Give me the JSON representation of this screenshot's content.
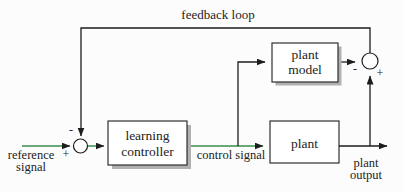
{
  "title": {
    "feedback_label": "feedback loop"
  },
  "blocks": {
    "learning_controller": {
      "line1": "learning",
      "line2": "controller"
    },
    "plant_model": {
      "line1": "plant",
      "line2": "model"
    },
    "plant": {
      "label": "plant"
    }
  },
  "signals": {
    "reference": {
      "line1": "reference",
      "line2": "signal"
    },
    "control": {
      "label": "control signal"
    },
    "output": {
      "line1": "plant",
      "line2": "output"
    }
  },
  "junctions": {
    "left": {
      "minus": "-",
      "plus": "+"
    },
    "right": {
      "minus": "-",
      "plus": "+"
    }
  },
  "colors": {
    "signal": "#3a8f4e",
    "line": "#1d1d1d",
    "shadow": "#b1b1b1",
    "page": "#fcfcfc"
  }
}
